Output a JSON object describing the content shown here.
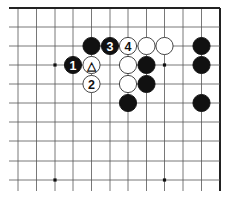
{
  "diagram": {
    "type": "go-board-corner",
    "corner": "top-right",
    "grid": {
      "columns_x": [
        18,
        36.5,
        55,
        73,
        91.5,
        110,
        128,
        146.5,
        164.5,
        183,
        201.5,
        220
      ],
      "rows_y": [
        8,
        27,
        46,
        65,
        84,
        103,
        122,
        141,
        161,
        180
      ],
      "left_extent": 9,
      "bottom_extent": 191,
      "line_color": "#555555",
      "edge_color": "#222222"
    },
    "star_points": [
      {
        "col": 2,
        "row": 3
      },
      {
        "col": 8,
        "row": 3
      },
      {
        "col": 2,
        "row": 9
      },
      {
        "col": 8,
        "row": 9
      }
    ],
    "stones": [
      {
        "color": "black",
        "col": 4,
        "row": 2,
        "label": ""
      },
      {
        "color": "black",
        "col": 5,
        "row": 2,
        "label": "3"
      },
      {
        "color": "white",
        "col": 6,
        "row": 2,
        "label": "4"
      },
      {
        "color": "white",
        "col": 7,
        "row": 2,
        "label": ""
      },
      {
        "color": "white",
        "col": 8,
        "row": 2,
        "label": ""
      },
      {
        "color": "black",
        "col": 10,
        "row": 2,
        "label": ""
      },
      {
        "color": "black",
        "col": 3,
        "row": 3,
        "label": "1"
      },
      {
        "color": "white",
        "col": 4,
        "row": 3,
        "label": "△"
      },
      {
        "color": "white",
        "col": 6,
        "row": 3,
        "label": ""
      },
      {
        "color": "black",
        "col": 7,
        "row": 3,
        "label": ""
      },
      {
        "color": "black",
        "col": 10,
        "row": 3,
        "label": ""
      },
      {
        "color": "white",
        "col": 4,
        "row": 4,
        "label": "2"
      },
      {
        "color": "white",
        "col": 6,
        "row": 4,
        "label": ""
      },
      {
        "color": "black",
        "col": 7,
        "row": 4,
        "label": ""
      },
      {
        "color": "black",
        "col": 6,
        "row": 5,
        "label": ""
      },
      {
        "color": "black",
        "col": 10,
        "row": 5,
        "label": ""
      }
    ],
    "colors": {
      "black_stone": "#111111",
      "white_stone": "#ffffff",
      "white_outline": "#333333",
      "black_label": "#ffffff",
      "white_label": "#111111"
    }
  }
}
